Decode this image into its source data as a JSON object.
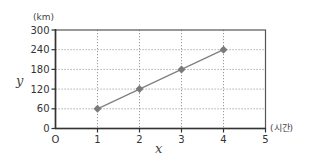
{
  "chart_data": {
    "type": "line",
    "title": "",
    "xlabel": "x",
    "ylabel": "y",
    "x_unit": "(시간)",
    "y_unit": "(km)",
    "x": [
      1,
      2,
      3,
      4
    ],
    "series": [
      {
        "name": "distance",
        "values": [
          60,
          120,
          180,
          240
        ],
        "marker": "diamond",
        "color": "#808080"
      }
    ],
    "xlim": [
      0,
      5
    ],
    "ylim": [
      0,
      300
    ],
    "x_ticks": [
      "0",
      "1",
      "2",
      "3",
      "4",
      "5"
    ],
    "y_ticks": [
      "0",
      "60",
      "120",
      "180",
      "240",
      "300"
    ],
    "grid": true,
    "grid_style": "dotted",
    "legend": "none"
  },
  "labels": {
    "origin": "O",
    "x_axis": "x",
    "y_axis": "y",
    "x_unit": "(시간)",
    "y_unit": "(km)"
  },
  "colors": {
    "axis": "#333333",
    "grid": "#9a9a9a",
    "line": "#808080",
    "marker": "#7a7a7a"
  }
}
